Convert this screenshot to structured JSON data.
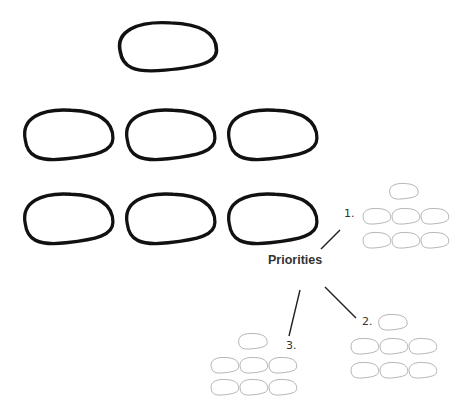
{
  "center_label": "Priorities",
  "branches": [
    {
      "number": "1.",
      "label_x": 344,
      "label_y": 207
    },
    {
      "number": "2.",
      "label_x": 362,
      "label_y": 315
    },
    {
      "number": "3.",
      "label_x": 286,
      "label_y": 339
    }
  ],
  "colors": {
    "big_stroke": "#111111",
    "small_stroke": "#555555",
    "background": "#ffffff"
  }
}
